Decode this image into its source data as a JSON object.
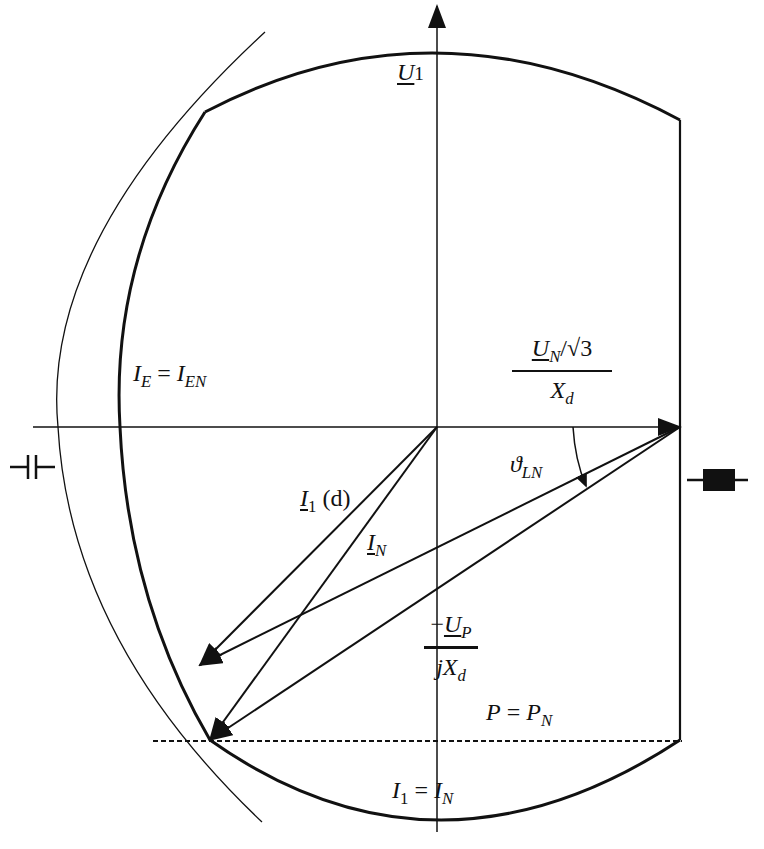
{
  "diagram": {
    "type": "synchronous machine current locus diagram",
    "colors": {
      "line": "#111111",
      "background": "#ffffff"
    },
    "labels": {
      "u1": {
        "main": "U",
        "sub": "1"
      },
      "ie_ien": {
        "left": "I",
        "left_sub": "E",
        "eq": " = ",
        "right": "I",
        "right_sub": "EN"
      },
      "un_frac": {
        "num_main": "U",
        "num_sub": "N",
        "num_rest": "/√3",
        "den_main": "X",
        "den_sub": "d"
      },
      "theta": {
        "main": "ϑ",
        "sub": "LN"
      },
      "i1d": {
        "main": "I",
        "sub": "1",
        "rest": " (d)"
      },
      "in": {
        "main": "I",
        "sub": "N"
      },
      "up_frac": {
        "num_prefix": "−",
        "num_main": "U",
        "num_sub": "P",
        "den_prefix": "j",
        "den_main": "X",
        "den_sub": "d"
      },
      "p_pn": {
        "left": "P",
        "eq": " = ",
        "right": "P",
        "right_sub": "N"
      },
      "i1_in": {
        "left": "I",
        "left_sub": "1",
        "eq": " = ",
        "right": "I",
        "right_sub": "N"
      }
    },
    "symbols": [
      "capacitor-symbol",
      "inductor-symbol"
    ]
  }
}
